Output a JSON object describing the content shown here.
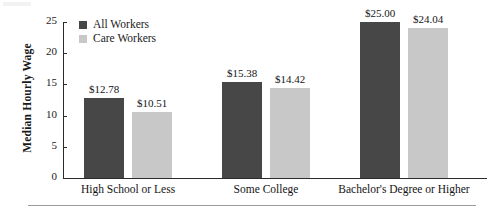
{
  "chart_data": {
    "type": "bar",
    "title": "",
    "xlabel": "",
    "ylabel": "Median Hourly Wage",
    "ylim": [
      0,
      25
    ],
    "yticks": [
      "0",
      "5",
      "10",
      "15",
      "20",
      "25"
    ],
    "ytick_values": [
      0,
      5,
      10,
      15,
      20,
      25
    ],
    "grid": false,
    "legend_position": "top-left",
    "categories": [
      "High School or Less",
      "Some College",
      "Bachelor's Degree or Higher"
    ],
    "series": [
      {
        "name": "All Workers",
        "color": "#474747",
        "values": [
          12.78,
          15.38,
          25.0
        ],
        "labels": [
          "$12.78",
          "$15.38",
          "$25.00"
        ]
      },
      {
        "name": "Care Workers",
        "color": "#c8c8c8",
        "values": [
          10.51,
          14.42,
          24.04
        ],
        "labels": [
          "$10.51",
          "$14.42",
          "$24.04"
        ]
      }
    ]
  },
  "colors": {
    "all_workers": "#474747",
    "care_workers": "#c8c8c8",
    "axis": "#2b2b2b",
    "rule": "#9a9a9a",
    "text": "#141414"
  },
  "axis": {
    "y_title": "Median Hourly Wage",
    "ticks": [
      {
        "label": "25",
        "value": 25
      },
      {
        "label": "20",
        "value": 20
      },
      {
        "label": "15",
        "value": 15
      },
      {
        "label": "10",
        "value": 10
      },
      {
        "label": "5",
        "value": 5
      },
      {
        "label": "0",
        "value": 0
      }
    ]
  },
  "legend": {
    "items": [
      {
        "label": "All Workers",
        "color": "#474747"
      },
      {
        "label": "Care Workers",
        "color": "#c8c8c8"
      }
    ]
  },
  "categories": [
    {
      "label": "High School or Less"
    },
    {
      "label": "Some College"
    },
    {
      "label": "Bachelor's Degree or Higher"
    }
  ],
  "bars": [
    {
      "label": "$12.78",
      "value": 12.78,
      "series": "All Workers"
    },
    {
      "label": "$10.51",
      "value": 10.51,
      "series": "Care Workers"
    },
    {
      "label": "$15.38",
      "value": 15.38,
      "series": "All Workers"
    },
    {
      "label": "$14.42",
      "value": 14.42,
      "series": "Care Workers"
    },
    {
      "label": "$25.00",
      "value": 25.0,
      "series": "All Workers"
    },
    {
      "label": "$24.04",
      "value": 24.04,
      "series": "Care Workers"
    }
  ]
}
